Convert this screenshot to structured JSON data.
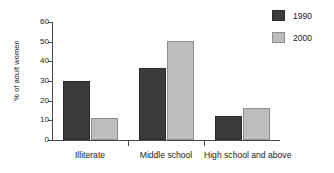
{
  "chart_data": {
    "type": "bar",
    "title": "",
    "subtitle": "",
    "xlabel": "",
    "ylabel": "% of adult women",
    "categories": [
      "Illiterate",
      "Middle school",
      "High school and above"
    ],
    "series": [
      {
        "name": "1990",
        "color": "#3b3b3b",
        "values": [
          30,
          36.5,
          12
        ]
      },
      {
        "name": "2000",
        "color": "#bdbdbd",
        "values": [
          11,
          50.5,
          16.5
        ]
      }
    ],
    "ylim": [
      0,
      60
    ],
    "yticks": [
      0,
      10,
      20,
      30,
      40,
      50,
      60
    ],
    "ytick_labels": [
      "0",
      "10",
      "20",
      "30",
      "40",
      "50",
      "60"
    ],
    "grid": false,
    "legend_position": "right-top",
    "annotations": []
  },
  "legend": {
    "entries": [
      {
        "label": "1990",
        "swatch": "dark-gray-swatch"
      },
      {
        "label": "2000",
        "swatch": "light-gray-swatch"
      }
    ]
  },
  "axes": {
    "y_label": "% of adult women",
    "y_tick_labels": [
      "60",
      "50",
      "40",
      "30",
      "20",
      "10",
      "0"
    ],
    "x_tick_labels": [
      "Illiterate",
      "Middle school",
      "High school and above"
    ]
  }
}
